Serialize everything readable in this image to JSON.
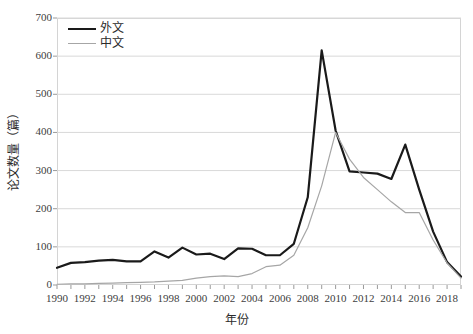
{
  "chart_data": {
    "type": "line",
    "title": "",
    "xlabel": "年份",
    "ylabel": "论文数量（篇）",
    "x": [
      1990,
      1991,
      1992,
      1993,
      1994,
      1995,
      1996,
      1997,
      1998,
      1999,
      2000,
      2001,
      2002,
      2003,
      2004,
      2005,
      2006,
      2007,
      2008,
      2009,
      2010,
      2011,
      2012,
      2013,
      2014,
      2015,
      2016,
      2017,
      2018,
      2019
    ],
    "xlim": [
      1990,
      2019
    ],
    "ylim": [
      0,
      700
    ],
    "ytick_labels": [
      "0",
      "100",
      "200",
      "300",
      "400",
      "500",
      "600",
      "700"
    ],
    "ytick_values": [
      0,
      100,
      200,
      300,
      400,
      500,
      600,
      700
    ],
    "xtick_labels": [
      "1990",
      "1992",
      "1994",
      "1996",
      "1998",
      "2000",
      "2002",
      "2004",
      "2006",
      "2008",
      "2010",
      "2012",
      "2014",
      "2016",
      "2018"
    ],
    "xtick_values": [
      1990,
      1992,
      1994,
      1996,
      1998,
      2000,
      2002,
      2004,
      2006,
      2008,
      2010,
      2012,
      2014,
      2016,
      2018
    ],
    "grid": "horizontal",
    "legend_position": "top-left",
    "series": [
      {
        "name": "外文",
        "color": "#1a1a1a",
        "width": 2.2,
        "values": [
          45,
          58,
          60,
          64,
          66,
          62,
          62,
          88,
          72,
          98,
          80,
          82,
          68,
          96,
          95,
          78,
          78,
          108,
          230,
          615,
          405,
          298,
          295,
          292,
          278,
          368,
          250,
          140,
          60,
          22
        ]
      },
      {
        "name": "中文",
        "color": "#a6a6a6",
        "width": 1.2,
        "values": [
          2,
          3,
          3,
          4,
          5,
          6,
          7,
          8,
          10,
          12,
          18,
          22,
          24,
          22,
          30,
          48,
          52,
          78,
          150,
          260,
          400,
          330,
          282,
          250,
          218,
          190,
          190,
          118,
          58,
          18
        ]
      }
    ]
  },
  "legend": {
    "items": [
      {
        "label": "外文"
      },
      {
        "label": "中文"
      }
    ]
  },
  "axes": {
    "x_title": "年份",
    "y_title": "论文数量（篇）"
  }
}
